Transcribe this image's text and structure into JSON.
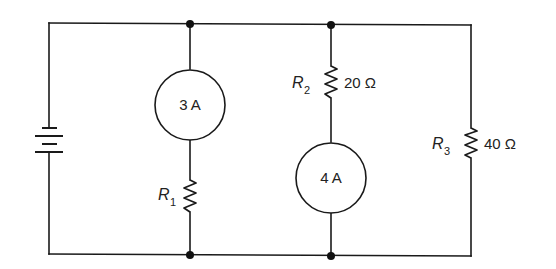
{
  "diagram": {
    "type": "circuit-schematic",
    "battery": {
      "label": ""
    },
    "current_sources": [
      {
        "id": "I1",
        "label": "3 A",
        "branch": "left-middle"
      },
      {
        "id": "I2",
        "label": "4 A",
        "branch": "right-middle"
      }
    ],
    "resistors": [
      {
        "id": "R1",
        "name": "R",
        "subscript": "1",
        "value": ""
      },
      {
        "id": "R2",
        "name": "R",
        "subscript": "2",
        "value": "20 Ω"
      },
      {
        "id": "R3",
        "name": "R",
        "subscript": "3",
        "value": "40 Ω"
      }
    ],
    "colors": {
      "line": "#1a1a1a",
      "background": "#ffffff"
    }
  }
}
